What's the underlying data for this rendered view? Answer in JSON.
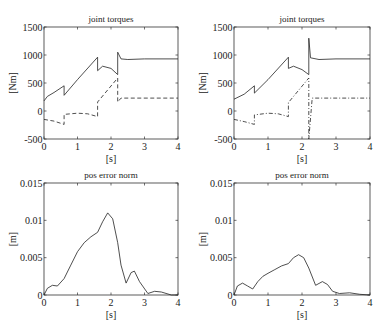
{
  "chart_data": [
    {
      "type": "line",
      "title": "joint torques",
      "xlabel": "[s]",
      "ylabel": "[Nm]",
      "xlim": [
        0,
        4
      ],
      "ylim": [
        -500,
        1500
      ],
      "xticks": [
        "0",
        "1",
        "2",
        "3",
        "4"
      ],
      "yticks": [
        "-500",
        "0",
        "500",
        "1000",
        "1500"
      ],
      "grid": false,
      "series": [
        {
          "name": "joint 1",
          "style": "solid",
          "x": [
            0,
            0.1,
            0.3,
            0.6,
            0.6,
            1.0,
            1.6,
            1.6,
            1.75,
            2.0,
            2.2,
            2.2,
            2.3,
            2.5,
            3.0,
            4.0
          ],
          "y": [
            180,
            260,
            330,
            450,
            280,
            560,
            960,
            720,
            800,
            760,
            650,
            1050,
            930,
            920,
            930,
            930
          ]
        },
        {
          "name": "joint 2",
          "style": "dashed",
          "x": [
            0,
            0.3,
            0.6,
            0.6,
            1.0,
            1.3,
            1.6,
            1.6,
            2.2,
            2.2,
            2.3,
            4.0
          ],
          "y": [
            -150,
            -180,
            -240,
            -60,
            -40,
            -50,
            -100,
            160,
            590,
            160,
            230,
            230
          ]
        }
      ]
    },
    {
      "type": "line",
      "title": "joint torques",
      "xlabel": "[s]",
      "ylabel": "[Nm]",
      "xlim": [
        0,
        4
      ],
      "ylim": [
        -500,
        1500
      ],
      "xticks": [
        "0",
        "1",
        "2",
        "3",
        "4"
      ],
      "yticks": [
        "-500",
        "0",
        "500",
        "1000",
        "1500"
      ],
      "grid": false,
      "series": [
        {
          "name": "joint 1",
          "style": "solid",
          "x": [
            0,
            0.3,
            0.6,
            0.6,
            1.0,
            1.6,
            1.6,
            1.75,
            2.0,
            2.2,
            2.2,
            2.25,
            2.5,
            3.0,
            4.0
          ],
          "y": [
            210,
            300,
            450,
            320,
            560,
            960,
            760,
            800,
            740,
            650,
            1300,
            950,
            920,
            930,
            930
          ]
        },
        {
          "name": "joint 2",
          "style": "dash-dot",
          "x": [
            0,
            0.3,
            0.6,
            0.6,
            1.0,
            1.3,
            1.6,
            1.6,
            2.2,
            2.2,
            2.3,
            4.0
          ],
          "y": [
            -150,
            -190,
            -240,
            -70,
            -40,
            -50,
            -100,
            150,
            590,
            -500,
            230,
            230
          ]
        }
      ]
    },
    {
      "type": "line",
      "title": "pos error norm",
      "xlabel": "[s]",
      "ylabel": "[m]",
      "xlim": [
        0,
        4
      ],
      "ylim": [
        0,
        0.015
      ],
      "xticks": [
        "0",
        "1",
        "2",
        "3",
        "4"
      ],
      "yticks": [
        "0",
        "0.005",
        "0.01",
        "0.015"
      ],
      "grid": false,
      "series": [
        {
          "name": "error",
          "style": "solid",
          "x": [
            0,
            0.1,
            0.25,
            0.4,
            0.6,
            0.8,
            1.0,
            1.2,
            1.4,
            1.6,
            1.75,
            1.9,
            2.05,
            2.2,
            2.3,
            2.45,
            2.6,
            2.7,
            2.85,
            3.1,
            3.3,
            3.5,
            3.8,
            4.0
          ],
          "y": [
            0,
            0.0009,
            0.0013,
            0.0012,
            0.0022,
            0.004,
            0.0058,
            0.007,
            0.0078,
            0.0084,
            0.0098,
            0.011,
            0.0102,
            0.007,
            0.004,
            0.0016,
            0.003,
            0.0032,
            0.0018,
            0.0002,
            0.0005,
            0.0004,
            0.0,
            0.0
          ]
        }
      ]
    },
    {
      "type": "line",
      "title": "pos error norm",
      "xlabel": "[s]",
      "ylabel": "[m]",
      "xlim": [
        0,
        4
      ],
      "ylim": [
        0,
        0.015
      ],
      "xticks": [
        "0",
        "1",
        "2",
        "3",
        "4"
      ],
      "yticks": [
        "0",
        "0.005",
        "0.01",
        "0.015"
      ],
      "grid": false,
      "series": [
        {
          "name": "error",
          "style": "solid",
          "x": [
            0,
            0.1,
            0.25,
            0.4,
            0.55,
            0.7,
            0.85,
            1.0,
            1.2,
            1.4,
            1.6,
            1.75,
            1.9,
            2.05,
            2.2,
            2.4,
            2.6,
            2.75,
            2.9,
            3.1,
            3.4,
            3.7,
            4.0
          ],
          "y": [
            0,
            0.0012,
            0.0016,
            0.0012,
            0.0008,
            0.0018,
            0.0025,
            0.0029,
            0.0034,
            0.0039,
            0.0042,
            0.005,
            0.0054,
            0.005,
            0.0036,
            0.0013,
            0.0018,
            0.0014,
            0.0005,
            0.0002,
            0.0003,
            0.0001,
            0.0
          ]
        }
      ]
    }
  ]
}
